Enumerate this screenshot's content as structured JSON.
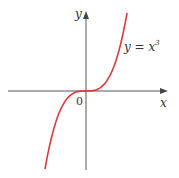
{
  "figure": {
    "x_axis_label": "x",
    "y_axis_label": "y",
    "origin_label": "0",
    "curve_label_base": "y = x",
    "curve_label_exponent": "3",
    "curve_color": "#d93a3f",
    "axis_color": "#555555"
  },
  "chart_data": {
    "type": "line",
    "title": "",
    "xlabel": "x",
    "ylabel": "y",
    "series": [
      {
        "name": "y = x^3",
        "function": "x^3"
      }
    ],
    "annotations": [
      "y = x^3",
      "0"
    ],
    "grid": false
  }
}
